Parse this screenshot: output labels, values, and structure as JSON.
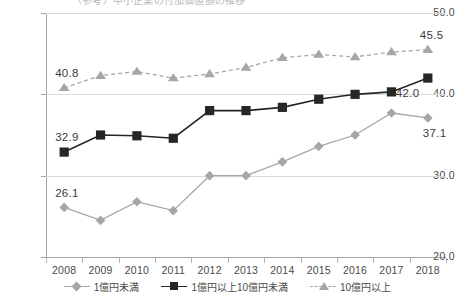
{
  "title_partial": "（参考）中小企業の付加価値額の推移",
  "axes": {
    "y_ticks": [
      "50.0",
      "40.0",
      "30.0",
      "20.0"
    ],
    "x_ticks": [
      "2008",
      "2009",
      "2010",
      "2011",
      "2012",
      "2013",
      "2014",
      "2015",
      "2016",
      "2017",
      "2018"
    ]
  },
  "legend": {
    "items": [
      {
        "label": "1億円未満",
        "marker": "diamond-marker",
        "color": "#a6a6a6",
        "dash": "solid"
      },
      {
        "label": "1億円以上10億円未満",
        "marker": "square-marker",
        "color": "#262626",
        "dash": "solid"
      },
      {
        "label": "10億円以上",
        "marker": "triangle-marker",
        "color": "#a6a6a6",
        "dash": "dashed"
      }
    ]
  },
  "value_labels": {
    "diamond_first": "26.1",
    "diamond_last": "37.1",
    "square_first": "32.9",
    "square_last": "42.0",
    "triangle_first": "40.8",
    "triangle_last": "45.5"
  },
  "chart_data": {
    "type": "line",
    "title": "（参考）中小企業の付加価値額の推移",
    "xlabel": "",
    "ylabel": "",
    "ylim": [
      20.0,
      50.0
    ],
    "yticks": [
      20.0,
      30.0,
      40.0,
      50.0
    ],
    "grid": true,
    "legend_position": "bottom",
    "categories": [
      "2008",
      "2009",
      "2010",
      "2011",
      "2012",
      "2013",
      "2014",
      "2015",
      "2016",
      "2017",
      "2018"
    ],
    "series": [
      {
        "name": "1億円未満",
        "marker": "diamond",
        "color": "#a6a6a6",
        "linestyle": "solid",
        "values": [
          26.1,
          24.5,
          26.8,
          25.7,
          30.0,
          30.0,
          31.7,
          33.6,
          35.0,
          37.7,
          37.1
        ],
        "labeled_points": {
          "2008": "26.1",
          "2018": "37.1"
        }
      },
      {
        "name": "1億円以上10億円未満",
        "marker": "square",
        "color": "#262626",
        "linestyle": "solid",
        "values": [
          32.9,
          35.0,
          34.9,
          34.6,
          38.0,
          38.0,
          38.4,
          39.4,
          40.0,
          40.3,
          42.0
        ],
        "labeled_points": {
          "2008": "32.9",
          "2018": "42.0"
        }
      },
      {
        "name": "10億円以上",
        "marker": "triangle",
        "color": "#a6a6a6",
        "linestyle": "dashed",
        "values": [
          40.8,
          42.3,
          42.8,
          42.0,
          42.5,
          43.3,
          44.5,
          44.9,
          44.6,
          45.2,
          45.5
        ],
        "labeled_points": {
          "2008": "40.8",
          "2018": "45.5"
        }
      }
    ]
  }
}
